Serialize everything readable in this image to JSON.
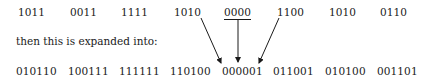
{
  "top_row": {
    "groups": [
      "1011",
      "0011",
      "1111",
      "1010",
      "0000",
      "1100",
      "1010",
      "0110"
    ],
    "underlined_index": 4
  },
  "caption": "then this is expanded into:",
  "bottom_row": {
    "groups": [
      "010110",
      "100111",
      "111111",
      "110100",
      "000001",
      "011001",
      "010100",
      "001101"
    ],
    "target_index": 4
  },
  "arrows": [
    {
      "from": "top_row.3 (1010)",
      "to": "bottom_row.4 (000001)"
    },
    {
      "from": "top_row.4 (0000)",
      "to": "bottom_row.4 (000001)"
    },
    {
      "from": "top_row.5 (1100)",
      "to": "bottom_row.4 (000001)"
    }
  ],
  "colors": {
    "text": "#1a1a1a",
    "background": "#ffffff"
  }
}
